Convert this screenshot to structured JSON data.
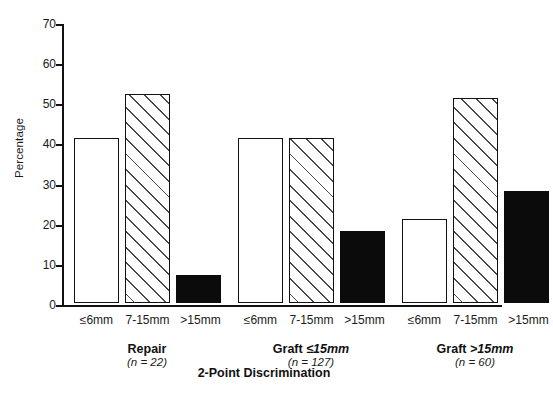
{
  "chart_data": {
    "type": "bar",
    "title": "",
    "xlabel": "2-Point Discrimination",
    "ylabel": "Percentage",
    "ylim": [
      0,
      70
    ],
    "yticks": [
      0,
      10,
      20,
      30,
      40,
      50,
      60,
      70
    ],
    "grid": false,
    "legend": "none",
    "categories": [
      "≤6mm",
      "7-15mm",
      ">15mm"
    ],
    "groups": [
      {
        "name": "Repair",
        "name_plain": "Repair",
        "name_italic_part": "",
        "n_label": "(n = 22)",
        "n": 22,
        "values": [
          41,
          52,
          7
        ]
      },
      {
        "name": "Graft ≤15mm",
        "name_plain": "Graft ",
        "name_italic_part": "≤15mm",
        "n_label": "(n = 127)",
        "n": 127,
        "values": [
          41,
          41,
          18
        ]
      },
      {
        "name": "Graft >15mm",
        "name_plain": "Graft ",
        "name_italic_part": ">15mm",
        "n_label": "(n = 60)",
        "n": 60,
        "values": [
          21,
          51,
          28
        ]
      }
    ],
    "series": [
      {
        "name": "≤6mm",
        "style": "open",
        "values": [
          41,
          41,
          21
        ]
      },
      {
        "name": "7-15mm",
        "style": "hatched",
        "values": [
          52,
          41,
          51
        ]
      },
      {
        "name": ">15mm",
        "style": "solid",
        "values": [
          7,
          18,
          28
        ]
      }
    ],
    "colors": {
      "axis": "#111111",
      "open_fill": "#ffffff",
      "solid_fill": "#0b0b0b",
      "hatch_line": "#4a4a4a",
      "background": "#ffffff",
      "text": "#1a1a1a"
    }
  }
}
